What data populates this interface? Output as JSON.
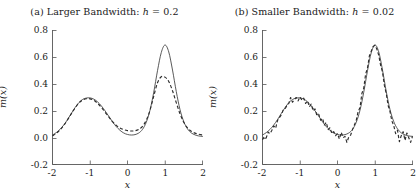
{
  "figure": {
    "width": 419,
    "height": 193,
    "background": "#ffffff",
    "line_color": "#3c3c3c",
    "axis_color": "#555555"
  },
  "panels": [
    {
      "id": "a",
      "title_plain": "(a) Larger Bandwidth: h = 0.2",
      "title_prefix": "(a) Larger Bandwidth: ",
      "title_var": "h",
      "title_eq": " = 0.2",
      "xlabel": "x",
      "ylabel": "m(x)",
      "xticks": [
        "-2",
        "-1",
        "0",
        "1",
        "2"
      ],
      "yticks": [
        "0.8",
        "0.6",
        "0.4",
        "0.2",
        "0.0",
        "-0.2"
      ]
    },
    {
      "id": "b",
      "title_plain": "(b) Smaller Bandwidth: h = 0.02",
      "title_prefix": "(b) Smaller Bandwidth: ",
      "title_var": "h",
      "title_eq": " = 0.02",
      "xlabel": "x",
      "ylabel": "m(x)",
      "xticks": [
        "-2",
        "-1",
        "0",
        "1",
        "2"
      ],
      "yticks": [
        "0.8",
        "0.6",
        "0.4",
        "0.2",
        "0.0",
        "-0.2"
      ]
    }
  ],
  "chart_data": [
    {
      "type": "line",
      "panel": "a",
      "title": "(a) Larger Bandwidth: h = 0.2",
      "xlabel": "x",
      "ylabel": "m(x)",
      "xlim": [
        -2,
        2
      ],
      "ylim": [
        -0.2,
        0.8
      ],
      "xticks": [
        -2,
        -1,
        0,
        1,
        2
      ],
      "yticks": [
        -0.2,
        0.0,
        0.2,
        0.4,
        0.6,
        0.8
      ],
      "grid": false,
      "legend": "none",
      "bandwidth_h": 0.2,
      "series": [
        {
          "name": "true-function",
          "style": "solid",
          "x": [
            -2.0,
            -1.9,
            -1.8,
            -1.7,
            -1.6,
            -1.5,
            -1.4,
            -1.3,
            -1.2,
            -1.1,
            -1.0,
            -0.9,
            -0.8,
            -0.7,
            -0.6,
            -0.5,
            -0.4,
            -0.3,
            -0.2,
            -0.1,
            0.0,
            0.1,
            0.2,
            0.3,
            0.4,
            0.5,
            0.6,
            0.7,
            0.8,
            0.9,
            1.0,
            1.1,
            1.2,
            1.3,
            1.4,
            1.5,
            1.6,
            1.7,
            1.8,
            1.9,
            2.0
          ],
          "y": [
            0.02,
            0.038,
            0.062,
            0.095,
            0.135,
            0.18,
            0.224,
            0.261,
            0.285,
            0.296,
            0.297,
            0.288,
            0.268,
            0.238,
            0.201,
            0.16,
            0.119,
            0.083,
            0.055,
            0.035,
            0.024,
            0.02,
            0.023,
            0.035,
            0.062,
            0.115,
            0.205,
            0.34,
            0.5,
            0.635,
            0.692,
            0.64,
            0.505,
            0.345,
            0.21,
            0.12,
            0.066,
            0.036,
            0.021,
            0.013,
            0.01
          ]
        },
        {
          "name": "kernel-estimate",
          "style": "dashed",
          "x": [
            -2.0,
            -1.9,
            -1.8,
            -1.7,
            -1.6,
            -1.5,
            -1.4,
            -1.3,
            -1.2,
            -1.1,
            -1.0,
            -0.9,
            -0.8,
            -0.7,
            -0.6,
            -0.5,
            -0.4,
            -0.3,
            -0.2,
            -0.1,
            0.0,
            0.1,
            0.2,
            0.3,
            0.4,
            0.5,
            0.6,
            0.7,
            0.8,
            0.9,
            1.0,
            1.1,
            1.2,
            1.3,
            1.4,
            1.5,
            1.6,
            1.7,
            1.8,
            1.9,
            2.0
          ],
          "y": [
            0.014,
            0.032,
            0.058,
            0.092,
            0.133,
            0.178,
            0.221,
            0.258,
            0.281,
            0.291,
            0.29,
            0.279,
            0.257,
            0.227,
            0.192,
            0.155,
            0.12,
            0.092,
            0.072,
            0.06,
            0.053,
            0.05,
            0.052,
            0.062,
            0.085,
            0.13,
            0.205,
            0.31,
            0.41,
            0.455,
            0.452,
            0.42,
            0.35,
            0.262,
            0.178,
            0.115,
            0.073,
            0.048,
            0.034,
            0.026,
            0.02
          ]
        }
      ]
    },
    {
      "type": "line",
      "panel": "b",
      "title": "(b) Smaller Bandwidth: h = 0.02",
      "xlabel": "x",
      "ylabel": "m(x)",
      "xlim": [
        -2,
        2
      ],
      "ylim": [
        -0.2,
        0.8
      ],
      "xticks": [
        -2,
        -1,
        0,
        1,
        2
      ],
      "yticks": [
        -0.2,
        0.0,
        0.2,
        0.4,
        0.6,
        0.8
      ],
      "grid": false,
      "legend": "none",
      "bandwidth_h": 0.02,
      "series": [
        {
          "name": "true-function",
          "style": "solid",
          "x": [
            -2.0,
            -1.9,
            -1.8,
            -1.7,
            -1.6,
            -1.5,
            -1.4,
            -1.3,
            -1.2,
            -1.1,
            -1.0,
            -0.9,
            -0.8,
            -0.7,
            -0.6,
            -0.5,
            -0.4,
            -0.3,
            -0.2,
            -0.1,
            0.0,
            0.1,
            0.2,
            0.3,
            0.4,
            0.5,
            0.6,
            0.7,
            0.8,
            0.9,
            1.0,
            1.1,
            1.2,
            1.3,
            1.4,
            1.5,
            1.6,
            1.7,
            1.8,
            1.9,
            2.0
          ],
          "y": [
            0.02,
            0.038,
            0.062,
            0.095,
            0.135,
            0.18,
            0.224,
            0.261,
            0.285,
            0.296,
            0.297,
            0.288,
            0.268,
            0.238,
            0.201,
            0.16,
            0.119,
            0.083,
            0.055,
            0.035,
            0.024,
            0.02,
            0.023,
            0.035,
            0.062,
            0.115,
            0.205,
            0.34,
            0.5,
            0.635,
            0.692,
            0.64,
            0.505,
            0.345,
            0.21,
            0.12,
            0.066,
            0.036,
            0.021,
            0.013,
            0.01
          ]
        },
        {
          "name": "kernel-estimate-noisy",
          "style": "dashed",
          "note": "high-frequency oscillation about the true curve; undersmoothed",
          "x": [
            -2.0,
            -1.95,
            -1.9,
            -1.85,
            -1.8,
            -1.75,
            -1.7,
            -1.65,
            -1.6,
            -1.55,
            -1.5,
            -1.45,
            -1.4,
            -1.35,
            -1.3,
            -1.25,
            -1.2,
            -1.15,
            -1.1,
            -1.05,
            -1.0,
            -0.95,
            -0.9,
            -0.85,
            -0.8,
            -0.75,
            -0.7,
            -0.65,
            -0.6,
            -0.55,
            -0.5,
            -0.45,
            -0.4,
            -0.35,
            -0.3,
            -0.25,
            -0.2,
            -0.15,
            -0.1,
            -0.05,
            0.0,
            0.05,
            0.1,
            0.15,
            0.2,
            0.25,
            0.3,
            0.35,
            0.4,
            0.45,
            0.5,
            0.55,
            0.6,
            0.65,
            0.7,
            0.75,
            0.8,
            0.85,
            0.9,
            0.95,
            1.0,
            1.05,
            1.1,
            1.15,
            1.2,
            1.25,
            1.3,
            1.35,
            1.4,
            1.45,
            1.5,
            1.55,
            1.6,
            1.65,
            1.7,
            1.75,
            1.8,
            1.85,
            1.9,
            1.95,
            2.0
          ],
          "y": [
            -0.015,
            0.01,
            0.0,
            0.042,
            0.03,
            0.055,
            0.088,
            0.07,
            0.128,
            0.15,
            0.17,
            0.205,
            0.215,
            0.24,
            0.255,
            0.3,
            0.265,
            0.285,
            0.3,
            0.275,
            0.305,
            0.28,
            0.295,
            0.255,
            0.275,
            0.23,
            0.25,
            0.2,
            0.215,
            0.165,
            0.175,
            0.13,
            0.145,
            0.095,
            0.115,
            0.06,
            0.075,
            0.03,
            0.045,
            0.015,
            0.03,
            -0.01,
            0.04,
            0.0,
            0.01,
            -0.035,
            0.005,
            0.02,
            0.06,
            0.095,
            0.13,
            0.195,
            0.225,
            0.33,
            0.37,
            0.475,
            0.52,
            0.61,
            0.645,
            0.68,
            0.69,
            0.66,
            0.615,
            0.54,
            0.49,
            0.39,
            0.33,
            0.24,
            0.195,
            0.125,
            0.09,
            0.03,
            0.055,
            -0.03,
            0.015,
            0.045,
            -0.02,
            0.035,
            0.0,
            -0.035,
            0.01
          ]
        }
      ]
    }
  ]
}
